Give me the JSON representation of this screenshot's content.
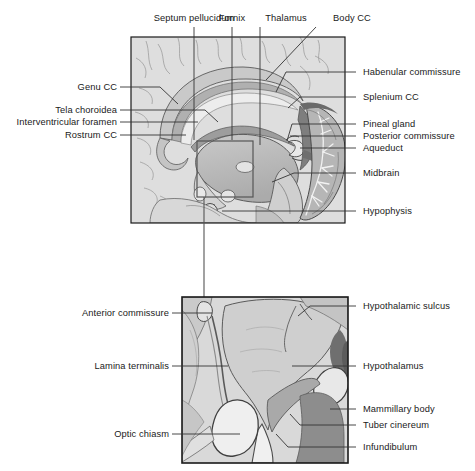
{
  "figure": {
    "panels": [
      {
        "name": "upper-panel",
        "caption": "Midsagittal section of brain"
      },
      {
        "name": "lower-panel",
        "caption": "Detail of hypothalamic region"
      }
    ]
  },
  "upper_labels": {
    "top": [
      {
        "id": "septum-pellucidum",
        "text": "Septum pellucidum"
      },
      {
        "id": "fornix",
        "text": "Fornix"
      },
      {
        "id": "thalamus",
        "text": "Thalamus"
      },
      {
        "id": "body-cc",
        "text": "Body CC"
      }
    ],
    "left": [
      {
        "id": "genu-cc",
        "text": "Genu CC"
      },
      {
        "id": "tela-choroidea",
        "text": "Tela choroidea"
      },
      {
        "id": "interventricular-foramen",
        "text": "Interventricular foramen"
      },
      {
        "id": "rostrum-cc",
        "text": "Rostrum CC"
      }
    ],
    "right": [
      {
        "id": "habenular-commissure",
        "text": "Habenular commissure"
      },
      {
        "id": "splenium-cc",
        "text": "Splenium CC"
      },
      {
        "id": "pineal-gland",
        "text": "Pineal gland"
      },
      {
        "id": "posterior-commissure",
        "text": "Posterior commissure"
      },
      {
        "id": "aqueduct",
        "text": "Aqueduct"
      },
      {
        "id": "midbrain",
        "text": "Midbrain"
      },
      {
        "id": "hypophysis",
        "text": "Hypophysis"
      }
    ]
  },
  "lower_labels": {
    "left": [
      {
        "id": "anterior-commissure",
        "text": "Anterior commissure"
      },
      {
        "id": "lamina-terminalis",
        "text": "Lamina terminalis"
      },
      {
        "id": "optic-chiasm",
        "text": "Optic chiasm"
      }
    ],
    "right": [
      {
        "id": "hypothalamic-sulcus",
        "text": "Hypothalamic sulcus"
      },
      {
        "id": "hypothalamus",
        "text": "Hypothalamus"
      },
      {
        "id": "mammillary-body",
        "text": "Mammillary body"
      },
      {
        "id": "tuber-cinereum",
        "text": "Tuber cinereum"
      },
      {
        "id": "infundibulum",
        "text": "Infundibulum"
      }
    ]
  },
  "colors": {
    "background": "#ffffff",
    "panel_border": "#1a1a1a",
    "leader_line": "#333333",
    "tissue_light": "#dcdcdc",
    "tissue_mid": "#c4c4c4",
    "tissue_dark": "#9a9a9a",
    "tissue_darker": "#7d7d7d",
    "ventricle": "#8f8f8f",
    "outline": "#4a4a4a",
    "white_structure": "#efefef",
    "text": "#1a1a1a"
  }
}
